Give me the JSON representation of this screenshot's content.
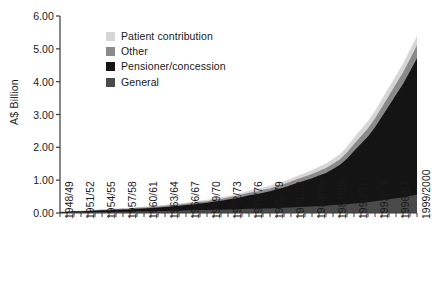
{
  "chart_data": {
    "type": "area",
    "stacked": true,
    "title": "",
    "xlabel": "",
    "ylabel": "A$ Billion",
    "ylim": [
      0,
      6
    ],
    "yticks": [
      "0.00",
      "1.00",
      "2.00",
      "3.00",
      "4.00",
      "5.00",
      "6.00"
    ],
    "ytick_values": [
      0,
      1,
      2,
      3,
      4,
      5,
      6
    ],
    "grid": false,
    "legend_position": "upper-left-inside",
    "x": [
      "1948/49",
      "1949/50",
      "1950/51",
      "1951/52",
      "1952/53",
      "1953/54",
      "1954/55",
      "1955/56",
      "1956/57",
      "1957/58",
      "1958/59",
      "1959/60",
      "1960/61",
      "1961/62",
      "1962/63",
      "1963/64",
      "1964/65",
      "1965/66",
      "1966/67",
      "1967/68",
      "1968/69",
      "1969/70",
      "1970/71",
      "1971/72",
      "1972/73",
      "1973/74",
      "1974/75",
      "1975/76",
      "1976/77",
      "1977/78",
      "1978/79",
      "1979/80",
      "1980/81",
      "1981/82",
      "1982/83",
      "1983/84",
      "1984/85",
      "1985/86",
      "1986/87",
      "1987/88",
      "1988/89",
      "1989/90",
      "1990/91",
      "1991/92",
      "1992/93",
      "1993/94",
      "1994/95",
      "1995/96",
      "1996/97",
      "1997/98",
      "1998/99",
      "1999/2000"
    ],
    "xtick_labels": [
      "1948/49",
      "1951/52",
      "1954/55",
      "1957/58",
      "1960/61",
      "1963/64",
      "1966/67",
      "1969/70",
      "1972/73",
      "1975/76",
      "1978/79",
      "1981/82",
      "1984/85",
      "1987/88",
      "1990/91",
      "1993/94",
      "1996/97",
      "1999/2000"
    ],
    "xtick_every": 3,
    "series": [
      {
        "name": "General",
        "color": "#4a4a4a",
        "values": [
          0.01,
          0.01,
          0.02,
          0.02,
          0.02,
          0.03,
          0.03,
          0.03,
          0.04,
          0.04,
          0.04,
          0.05,
          0.05,
          0.05,
          0.06,
          0.06,
          0.07,
          0.07,
          0.08,
          0.08,
          0.09,
          0.09,
          0.1,
          0.1,
          0.11,
          0.11,
          0.12,
          0.13,
          0.13,
          0.14,
          0.14,
          0.15,
          0.16,
          0.17,
          0.18,
          0.19,
          0.2,
          0.21,
          0.22,
          0.24,
          0.25,
          0.27,
          0.29,
          0.31,
          0.33,
          0.36,
          0.39,
          0.42,
          0.45,
          0.48,
          0.52,
          0.56
        ]
      },
      {
        "name": "Pensioner/concession",
        "color": "#141414",
        "values": [
          0.02,
          0.02,
          0.03,
          0.03,
          0.04,
          0.04,
          0.05,
          0.05,
          0.06,
          0.07,
          0.07,
          0.08,
          0.09,
          0.1,
          0.11,
          0.12,
          0.13,
          0.15,
          0.16,
          0.18,
          0.2,
          0.22,
          0.25,
          0.27,
          0.3,
          0.33,
          0.37,
          0.41,
          0.44,
          0.48,
          0.52,
          0.57,
          0.62,
          0.68,
          0.74,
          0.8,
          0.86,
          0.93,
          1.0,
          1.1,
          1.22,
          1.38,
          1.6,
          1.8,
          2.0,
          2.25,
          2.55,
          2.85,
          3.15,
          3.45,
          3.8,
          4.15
        ]
      },
      {
        "name": "Other",
        "color": "#8a8a8a",
        "values": [
          0.01,
          0.01,
          0.01,
          0.01,
          0.01,
          0.02,
          0.02,
          0.02,
          0.02,
          0.02,
          0.02,
          0.03,
          0.03,
          0.03,
          0.03,
          0.04,
          0.04,
          0.04,
          0.04,
          0.05,
          0.05,
          0.05,
          0.06,
          0.06,
          0.06,
          0.07,
          0.07,
          0.08,
          0.08,
          0.09,
          0.09,
          0.1,
          0.1,
          0.11,
          0.12,
          0.12,
          0.13,
          0.14,
          0.15,
          0.16,
          0.17,
          0.19,
          0.21,
          0.23,
          0.25,
          0.27,
          0.29,
          0.31,
          0.33,
          0.35,
          0.37,
          0.4
        ]
      },
      {
        "name": "Patient contribution",
        "color": "#d6d6d6",
        "values": [
          0.01,
          0.01,
          0.01,
          0.01,
          0.01,
          0.01,
          0.01,
          0.02,
          0.02,
          0.02,
          0.02,
          0.02,
          0.02,
          0.03,
          0.03,
          0.03,
          0.03,
          0.03,
          0.04,
          0.04,
          0.04,
          0.04,
          0.05,
          0.05,
          0.05,
          0.06,
          0.06,
          0.06,
          0.07,
          0.07,
          0.08,
          0.08,
          0.09,
          0.09,
          0.1,
          0.11,
          0.12,
          0.13,
          0.14,
          0.15,
          0.16,
          0.18,
          0.2,
          0.21,
          0.22,
          0.23,
          0.24,
          0.25,
          0.26,
          0.27,
          0.28,
          0.29
        ]
      }
    ],
    "totals_note": "Stacked total rises from about 0.05 in 1948/49 to about 5.40 in 1999/2000"
  },
  "legend": {
    "items": [
      {
        "label": "Patient contribution",
        "color": "#d6d6d6"
      },
      {
        "label": "Other",
        "color": "#8a8a8a"
      },
      {
        "label": "Pensioner/concession",
        "color": "#141414"
      },
      {
        "label": "General",
        "color": "#4a4a4a"
      }
    ]
  },
  "axis": {
    "y_title": "A$ Billion",
    "axis_color": "#3a3a3a"
  }
}
